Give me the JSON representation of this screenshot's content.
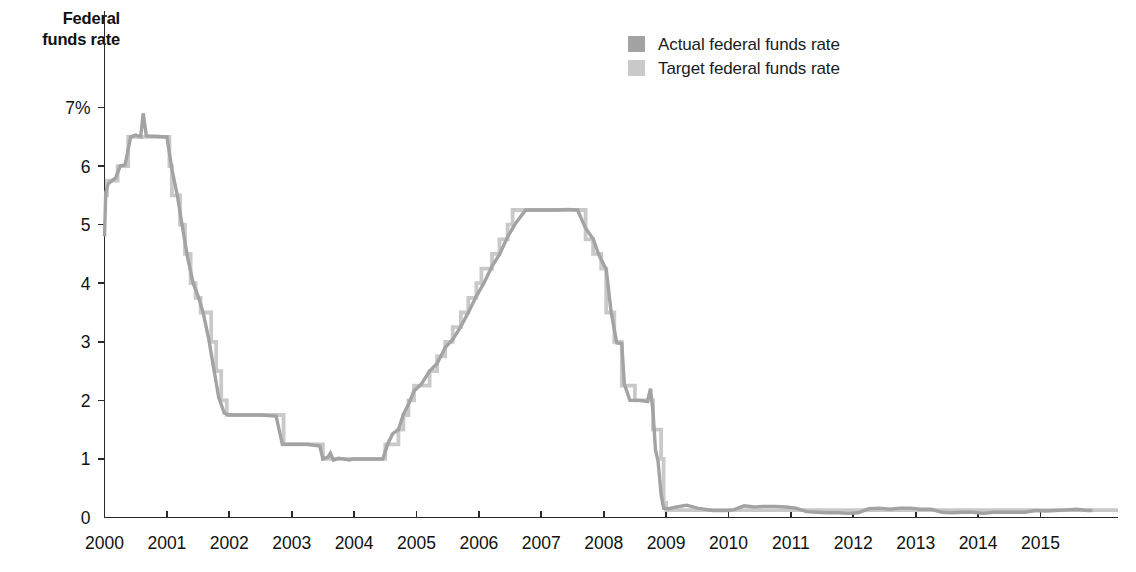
{
  "axis_title": {
    "line1": "Federal",
    "line2": "funds rate"
  },
  "legend": {
    "position": "top-right-inside",
    "items": [
      {
        "label": "Actual federal funds rate",
        "color": "#a3a3a3",
        "key": "actual"
      },
      {
        "label": "Target federal funds rate",
        "color": "#c9c9c9",
        "key": "target"
      }
    ]
  },
  "chart_data": {
    "type": "line",
    "title": "",
    "subtitle": "",
    "xlabel": "",
    "ylabel": "Federal funds rate",
    "ylabel_lines": [
      "Federal",
      "funds rate"
    ],
    "grid": false,
    "legend_position": "top-right",
    "xlim": [
      2000,
      2015.83
    ],
    "ylim": [
      0,
      7
    ],
    "yticks": [
      0,
      1,
      2,
      3,
      4,
      5,
      6,
      7
    ],
    "ytick_labels": [
      "0",
      "1",
      "2",
      "3",
      "4",
      "5",
      "6",
      "7%"
    ],
    "y_unit": "%",
    "xticks": [
      2000,
      2001,
      2002,
      2003,
      2004,
      2005,
      2006,
      2007,
      2008,
      2009,
      2010,
      2011,
      2012,
      2013,
      2014,
      2015
    ],
    "xtick_labels": [
      "2000",
      "2001",
      "2002",
      "2003",
      "2004",
      "2005",
      "2006",
      "2007",
      "2008",
      "2009",
      "2010",
      "2011",
      "2012",
      "2013",
      "2014",
      "2015"
    ],
    "series": [
      {
        "name": "Target federal funds rate",
        "key": "target",
        "color": "#c9c9c9",
        "x": [
          2000.0,
          2000.04,
          2000.12,
          2000.21,
          2000.29,
          2000.38,
          2000.46,
          2000.5,
          2000.62,
          2000.79,
          2000.96,
          2001.0,
          2001.04,
          2001.08,
          2001.17,
          2001.21,
          2001.29,
          2001.38,
          2001.46,
          2001.54,
          2001.71,
          2001.79,
          2001.87,
          2001.96,
          2002.0,
          2002.5,
          2002.87,
          2002.96,
          2003.0,
          2003.5,
          2003.54,
          2004.0,
          2004.46,
          2004.5,
          2004.58,
          2004.71,
          2004.79,
          2004.87,
          2004.96,
          2005.04,
          2005.21,
          2005.33,
          2005.46,
          2005.58,
          2005.71,
          2005.83,
          2005.96,
          2006.04,
          2006.21,
          2006.33,
          2006.46,
          2006.54,
          2007.0,
          2007.5,
          2007.71,
          2007.83,
          2007.96,
          2008.04,
          2008.17,
          2008.21,
          2008.29,
          2008.5,
          2008.75,
          2008.79,
          2008.92,
          2008.96,
          2009.0,
          2010.0,
          2011.0,
          2012.0,
          2013.0,
          2014.0,
          2015.0,
          2015.83
        ],
        "y": [
          5.5,
          5.75,
          5.75,
          6.0,
          6.0,
          6.5,
          6.5,
          6.5,
          6.5,
          6.5,
          6.5,
          6.5,
          6.0,
          5.5,
          5.5,
          5.0,
          4.5,
          4.0,
          3.75,
          3.5,
          3.0,
          2.5,
          2.0,
          1.75,
          1.75,
          1.75,
          1.25,
          1.25,
          1.25,
          1.0,
          1.0,
          1.0,
          1.0,
          1.25,
          1.25,
          1.5,
          1.75,
          2.0,
          2.25,
          2.25,
          2.5,
          2.75,
          3.0,
          3.25,
          3.5,
          3.75,
          4.0,
          4.25,
          4.5,
          4.75,
          5.0,
          5.25,
          5.25,
          5.25,
          4.75,
          4.5,
          4.25,
          3.5,
          3.0,
          3.0,
          2.25,
          2.0,
          2.0,
          1.5,
          1.0,
          0.25,
          0.125,
          0.125,
          0.125,
          0.125,
          0.125,
          0.125,
          0.125,
          0.125
        ],
        "note": "FOMC target; step function, flat between policy changes"
      },
      {
        "name": "Actual federal funds rate",
        "key": "actual",
        "color": "#a3a3a3",
        "x": [
          2000.0,
          2000.02,
          2000.06,
          2000.12,
          2000.18,
          2000.25,
          2000.33,
          2000.42,
          2000.5,
          2000.58,
          2000.62,
          2000.67,
          2000.75,
          2000.83,
          2000.92,
          2001.0,
          2001.08,
          2001.17,
          2001.25,
          2001.33,
          2001.42,
          2001.5,
          2001.58,
          2001.67,
          2001.75,
          2001.83,
          2001.92,
          2002.0,
          2002.25,
          2002.5,
          2002.75,
          2002.85,
          2002.92,
          2003.0,
          2003.25,
          2003.45,
          2003.5,
          2003.58,
          2003.62,
          2003.67,
          2003.75,
          2003.83,
          2003.92,
          2004.0,
          2004.17,
          2004.33,
          2004.46,
          2004.54,
          2004.62,
          2004.71,
          2004.79,
          2004.87,
          2004.96,
          2005.08,
          2005.21,
          2005.33,
          2005.46,
          2005.58,
          2005.71,
          2005.83,
          2005.96,
          2006.08,
          2006.21,
          2006.33,
          2006.46,
          2006.58,
          2006.75,
          2006.92,
          2007.08,
          2007.25,
          2007.42,
          2007.58,
          2007.71,
          2007.83,
          2007.92,
          2008.04,
          2008.12,
          2008.21,
          2008.29,
          2008.33,
          2008.42,
          2008.58,
          2008.7,
          2008.75,
          2008.79,
          2008.83,
          2008.87,
          2008.92,
          2008.96,
          2009.04,
          2009.17,
          2009.33,
          2009.5,
          2009.75,
          2009.96,
          2010.08,
          2010.25,
          2010.42,
          2010.58,
          2010.75,
          2010.92,
          2011.08,
          2011.25,
          2011.42,
          2011.58,
          2011.75,
          2011.92,
          2012.08,
          2012.25,
          2012.42,
          2012.58,
          2012.75,
          2012.92,
          2013.08,
          2013.25,
          2013.42,
          2013.58,
          2013.75,
          2013.92,
          2014.08,
          2014.25,
          2014.42,
          2014.58,
          2014.75,
          2014.92,
          2015.08,
          2015.25,
          2015.42,
          2015.58,
          2015.75,
          2015.83
        ],
        "y": [
          4.8,
          5.55,
          5.7,
          5.75,
          5.8,
          6.0,
          6.02,
          6.5,
          6.53,
          6.5,
          6.9,
          6.52,
          6.51,
          6.51,
          6.5,
          6.5,
          5.95,
          5.48,
          4.95,
          4.45,
          4.0,
          3.78,
          3.5,
          3.05,
          2.55,
          2.05,
          1.78,
          1.75,
          1.75,
          1.75,
          1.73,
          1.25,
          1.25,
          1.25,
          1.25,
          1.22,
          1.0,
          1.03,
          1.1,
          0.98,
          1.01,
          1.0,
          0.98,
          1.0,
          1.0,
          1.0,
          1.0,
          1.26,
          1.43,
          1.5,
          1.76,
          1.93,
          2.16,
          2.28,
          2.5,
          2.63,
          2.9,
          3.04,
          3.26,
          3.5,
          3.78,
          4.0,
          4.29,
          4.49,
          4.79,
          5.01,
          5.25,
          5.25,
          5.25,
          5.25,
          5.26,
          5.25,
          4.94,
          4.76,
          4.49,
          4.24,
          3.5,
          2.98,
          2.97,
          2.28,
          2.0,
          2.0,
          1.98,
          2.2,
          1.81,
          1.15,
          0.97,
          0.39,
          0.16,
          0.15,
          0.18,
          0.21,
          0.16,
          0.12,
          0.12,
          0.13,
          0.2,
          0.18,
          0.19,
          0.19,
          0.18,
          0.16,
          0.1,
          0.09,
          0.08,
          0.08,
          0.07,
          0.08,
          0.15,
          0.16,
          0.14,
          0.16,
          0.16,
          0.14,
          0.14,
          0.09,
          0.08,
          0.09,
          0.09,
          0.07,
          0.09,
          0.09,
          0.09,
          0.09,
          0.12,
          0.11,
          0.12,
          0.13,
          0.14,
          0.12,
          0.12
        ],
        "note": "Effective federal funds rate; noisy daily/monthly series tracking the target"
      }
    ]
  },
  "style": {
    "background": "#ffffff",
    "axis_color": "#2a2a2a",
    "text_color": "#111111",
    "actual_color": "#a3a3a3",
    "target_color": "#c9c9c9",
    "line_width": 3.4
  }
}
